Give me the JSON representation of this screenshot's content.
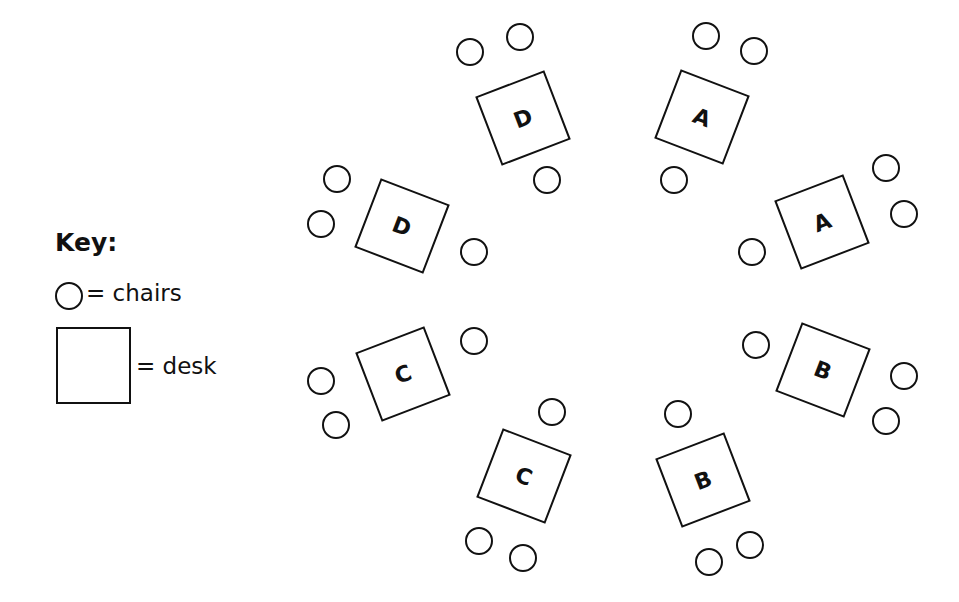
{
  "key": {
    "title": "Key:",
    "chair_label": "= chairs",
    "desk_label": "= desk"
  },
  "colors": {
    "stroke": "#111111",
    "background": "#ffffff"
  },
  "desks": [
    {
      "id": "desk-d-top",
      "label": "D",
      "cx": 523,
      "cy": 118,
      "rotation": -21
    },
    {
      "id": "desk-a-top",
      "label": "A",
      "cx": 702,
      "cy": 117,
      "rotation": 21
    },
    {
      "id": "desk-a-right",
      "label": "A",
      "cx": 822,
      "cy": 222,
      "rotation": -21
    },
    {
      "id": "desk-b-right",
      "label": "B",
      "cx": 823,
      "cy": 370,
      "rotation": 21
    },
    {
      "id": "desk-b-bottom",
      "label": "B",
      "cx": 703,
      "cy": 480,
      "rotation": -21
    },
    {
      "id": "desk-c-bottom",
      "label": "C",
      "cx": 524,
      "cy": 476,
      "rotation": 21
    },
    {
      "id": "desk-c-left",
      "label": "C",
      "cx": 403,
      "cy": 374,
      "rotation": -21
    },
    {
      "id": "desk-d-left",
      "label": "D",
      "cx": 402,
      "cy": 226,
      "rotation": 21
    }
  ],
  "chairs": [
    {
      "cx": 470,
      "cy": 52
    },
    {
      "cx": 520,
      "cy": 37
    },
    {
      "cx": 547,
      "cy": 180
    },
    {
      "cx": 706,
      "cy": 36
    },
    {
      "cx": 754,
      "cy": 51
    },
    {
      "cx": 674,
      "cy": 180
    },
    {
      "cx": 886,
      "cy": 168
    },
    {
      "cx": 904,
      "cy": 214
    },
    {
      "cx": 752,
      "cy": 252
    },
    {
      "cx": 756,
      "cy": 345
    },
    {
      "cx": 904,
      "cy": 376
    },
    {
      "cx": 886,
      "cy": 421
    },
    {
      "cx": 678,
      "cy": 414
    },
    {
      "cx": 709,
      "cy": 562
    },
    {
      "cx": 750,
      "cy": 545
    },
    {
      "cx": 552,
      "cy": 412
    },
    {
      "cx": 479,
      "cy": 541
    },
    {
      "cx": 523,
      "cy": 558
    },
    {
      "cx": 474,
      "cy": 341
    },
    {
      "cx": 321,
      "cy": 381
    },
    {
      "cx": 336,
      "cy": 425
    },
    {
      "cx": 337,
      "cy": 179
    },
    {
      "cx": 321,
      "cy": 224
    },
    {
      "cx": 474,
      "cy": 252
    }
  ]
}
